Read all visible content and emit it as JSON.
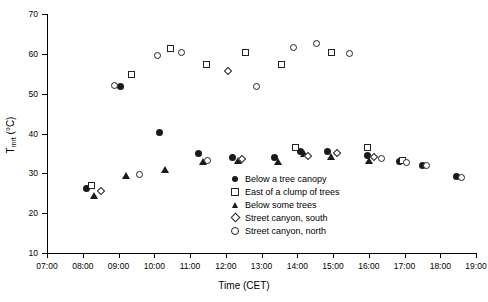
{
  "chart_data": {
    "type": "scatter",
    "title": "",
    "xlabel": "Time  (CET)",
    "ylabel": "T",
    "ylabel_sub": "mrt",
    "ylabel_unit": "  (°C)",
    "xlim_hours": [
      7,
      19
    ],
    "ylim": [
      10,
      70
    ],
    "yticks": [
      10,
      20,
      30,
      40,
      50,
      60,
      70
    ],
    "ytick_labels": [
      "10",
      "20",
      "30",
      "40",
      "50",
      "60",
      "70"
    ],
    "xticks": [
      "07:00",
      "08:00",
      "09:00",
      "10:00",
      "11:00",
      "12:00",
      "13:00",
      "14:00",
      "15:00",
      "16:00",
      "17:00",
      "18:00",
      "19:00"
    ],
    "grid": false,
    "legend_position": "inside-center-bottom",
    "marker_color": "#1a1a1a",
    "series": [
      {
        "name": "Below a tree canopy",
        "marker": "circle-filled",
        "points": [
          {
            "x": 8.1,
            "y": 26.1
          },
          {
            "x": 9.05,
            "y": 51.7
          },
          {
            "x": 10.15,
            "y": 40.3
          },
          {
            "x": 11.25,
            "y": 34.9
          },
          {
            "x": 12.2,
            "y": 34.0
          },
          {
            "x": 13.35,
            "y": 33.9
          },
          {
            "x": 14.1,
            "y": 35.4
          },
          {
            "x": 14.85,
            "y": 35.6
          },
          {
            "x": 15.95,
            "y": 34.6
          },
          {
            "x": 16.85,
            "y": 33.0
          },
          {
            "x": 17.5,
            "y": 32.1
          },
          {
            "x": 18.45,
            "y": 29.3
          }
        ]
      },
      {
        "name": "East of a clump of trees",
        "marker": "square-open",
        "points": [
          {
            "x": 8.25,
            "y": 27.0
          },
          {
            "x": 9.35,
            "y": 54.8
          },
          {
            "x": 10.45,
            "y": 61.4
          },
          {
            "x": 11.45,
            "y": 57.3
          },
          {
            "x": 12.55,
            "y": 60.4
          },
          {
            "x": 13.55,
            "y": 57.4
          },
          {
            "x": 14.95,
            "y": 60.3
          },
          {
            "x": 13.95,
            "y": 36.6
          },
          {
            "x": 15.95,
            "y": 36.4
          },
          {
            "x": 16.95,
            "y": 33.3
          }
        ]
      },
      {
        "name": "Below some trees",
        "marker": "tri-filled",
        "points": [
          {
            "x": 8.3,
            "y": 24.5
          },
          {
            "x": 9.2,
            "y": 29.5
          },
          {
            "x": 10.3,
            "y": 31.0
          },
          {
            "x": 11.35,
            "y": 33.1
          },
          {
            "x": 12.35,
            "y": 33.2
          },
          {
            "x": 13.45,
            "y": 33.0
          },
          {
            "x": 14.2,
            "y": 35.1
          },
          {
            "x": 14.95,
            "y": 34.3
          },
          {
            "x": 16.0,
            "y": 33.2
          }
        ]
      },
      {
        "name": "Street canyon, south",
        "marker": "diamond-open",
        "points": [
          {
            "x": 8.5,
            "y": 25.6
          },
          {
            "x": 12.05,
            "y": 55.6
          },
          {
            "x": 12.45,
            "y": 33.6
          },
          {
            "x": 14.3,
            "y": 34.4
          },
          {
            "x": 15.1,
            "y": 35.1
          },
          {
            "x": 16.15,
            "y": 34.0
          }
        ]
      },
      {
        "name": "Street canyon, north",
        "marker": "circle-open",
        "points": [
          {
            "x": 8.9,
            "y": 52.0
          },
          {
            "x": 9.6,
            "y": 29.8
          },
          {
            "x": 10.1,
            "y": 59.5
          },
          {
            "x": 10.75,
            "y": 60.3
          },
          {
            "x": 11.5,
            "y": 33.3
          },
          {
            "x": 12.85,
            "y": 51.7
          },
          {
            "x": 13.9,
            "y": 61.6
          },
          {
            "x": 14.55,
            "y": 62.7
          },
          {
            "x": 15.45,
            "y": 60.2
          },
          {
            "x": 16.35,
            "y": 33.8
          },
          {
            "x": 17.05,
            "y": 32.7
          },
          {
            "x": 17.6,
            "y": 32.1
          },
          {
            "x": 18.6,
            "y": 29.0
          }
        ]
      }
    ]
  },
  "legend": {
    "items": [
      {
        "label": "Below a tree canopy",
        "marker": "circle-filled"
      },
      {
        "label": "East of a clump of trees",
        "marker": "square-open"
      },
      {
        "label": "Below some trees",
        "marker": "tri-filled"
      },
      {
        "label": "Street canyon, south",
        "marker": "diamond-open"
      },
      {
        "label": "Street canyon, north",
        "marker": "circle-open"
      }
    ]
  }
}
